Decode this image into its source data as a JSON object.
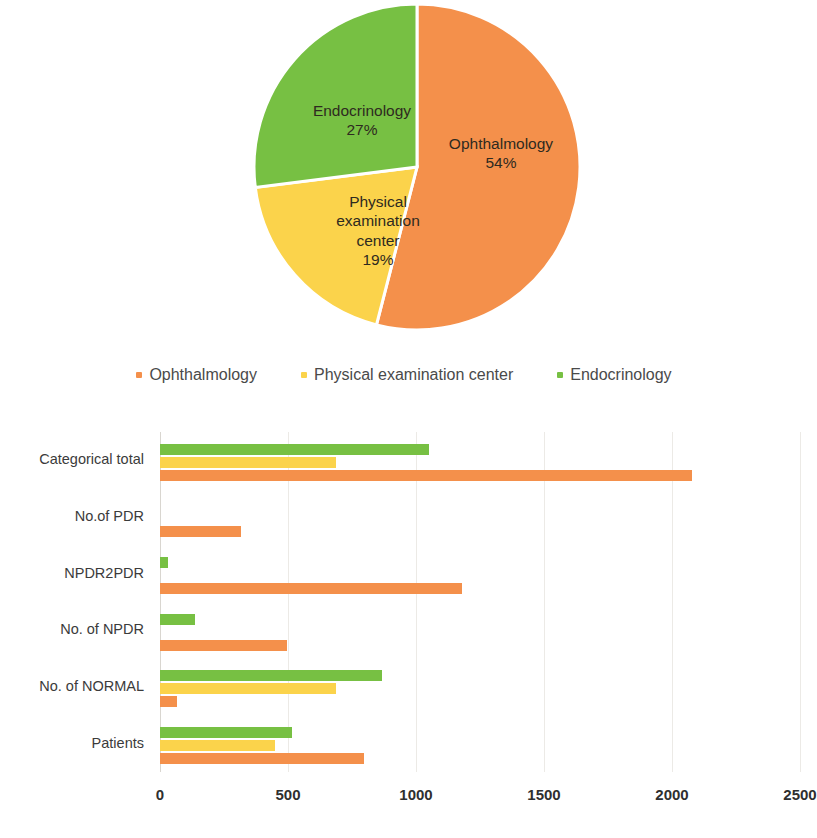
{
  "colors": {
    "ophthalmology": "#F4904B",
    "physical_examination_center": "#FBD34B",
    "endocrinology": "#77C043",
    "gridline": "#ECEAE6",
    "text": "#3B3B3B"
  },
  "pie": {
    "slices": [
      {
        "label": "Ophthalmology",
        "percent": 54,
        "percent_text": "54%",
        "color_key": "ophthalmology"
      },
      {
        "label": "Endocrinology",
        "percent": 27,
        "percent_text": "27%",
        "color_key": "endocrinology"
      },
      {
        "label": "Physical examination center",
        "label_lines": [
          "Physical",
          "examination",
          "center"
        ],
        "percent": 19,
        "percent_text": "19%",
        "color_key": "physical_examination_center"
      }
    ]
  },
  "legend": {
    "items": [
      {
        "label": "Ophthalmology",
        "color_key": "ophthalmology"
      },
      {
        "label": "Physical examination center",
        "color_key": "physical_examination_center"
      },
      {
        "label": "Endocrinology",
        "color_key": "endocrinology"
      }
    ]
  },
  "chart_data": [
    {
      "type": "pie",
      "title": "",
      "categories": [
        "Ophthalmology",
        "Physical examination center",
        "Endocrinology"
      ],
      "values": [
        54,
        19,
        27
      ],
      "value_labels": [
        "54%",
        "19%",
        "27%"
      ],
      "unit": "percent",
      "legend_position": "bottom",
      "colors": [
        "#F4904B",
        "#FBD34B",
        "#77C043"
      ]
    },
    {
      "type": "bar",
      "orientation": "horizontal",
      "title": "",
      "xlabel": "",
      "ylabel": "",
      "xlim": [
        0,
        2500
      ],
      "xticks": [
        0,
        500,
        1000,
        1500,
        2000,
        2500
      ],
      "xtick_labels": [
        "0",
        "500",
        "1000",
        "1500",
        "2000",
        "2500"
      ],
      "grid": true,
      "legend_position": "above-chart",
      "categories": [
        "Patients",
        "No. of NORMAL",
        "No. of NPDR",
        "NPDR2PDR",
        "No.of PDR",
        "Categorical total"
      ],
      "categories_top_to_bottom": [
        "Categorical total",
        "No.of PDR",
        "NPDR2PDR",
        "No. of NPDR",
        "No. of NORMAL",
        "Patients"
      ],
      "series": [
        {
          "name": "Ophthalmology",
          "color": "#F4904B",
          "values_top_to_bottom": [
            2080,
            318,
            1180,
            498,
            68,
            795
          ]
        },
        {
          "name": "Physical examination center",
          "color": "#FBD34B",
          "values_top_to_bottom": [
            688,
            0,
            0,
            0,
            688,
            448
          ]
        },
        {
          "name": "Endocrinology",
          "color": "#77C043",
          "values_top_to_bottom": [
            1052,
            0,
            30,
            138,
            868,
            516
          ]
        }
      ]
    }
  ]
}
